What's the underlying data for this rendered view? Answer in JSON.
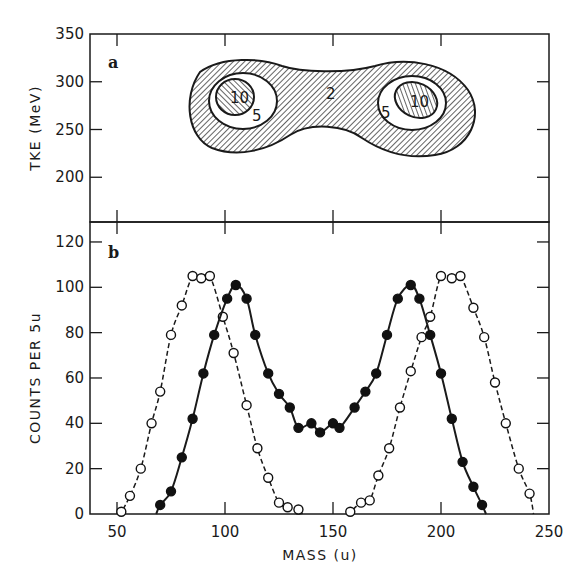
{
  "figure": {
    "panels": [
      {
        "id": "a",
        "label": "a"
      },
      {
        "id": "b",
        "label": "b"
      }
    ]
  },
  "chart_data": [
    {
      "type": "heatmap",
      "panel": "a",
      "title": "",
      "xlabel": "",
      "ylabel": "TKE (MeV)",
      "xlim": [
        40,
        250
      ],
      "ylim": [
        150,
        350
      ],
      "yticks": [
        200,
        250,
        300,
        350
      ],
      "xticks": [
        50,
        100,
        150,
        200,
        250
      ],
      "contour_levels": [
        2,
        5,
        10
      ],
      "contours": [
        {
          "level": 2,
          "label": "2",
          "label_pos": [
            150,
            288
          ],
          "extent_mass": [
            85,
            220
          ],
          "extent_tke": [
            225,
            325
          ]
        },
        {
          "level": 5,
          "label": "5",
          "label_pos": [
            104,
            260
          ],
          "center": [
            95,
            278
          ]
        },
        {
          "level": 10,
          "label": "10",
          "label_pos": [
            95,
            283
          ],
          "center": [
            95,
            282
          ]
        },
        {
          "level": 5,
          "label": "5",
          "label_pos": [
            186,
            264
          ],
          "center": [
            200,
            278
          ]
        },
        {
          "level": 10,
          "label": "10",
          "label_pos": [
            202,
            276
          ],
          "center": [
            202,
            276
          ]
        }
      ],
      "grid": false
    },
    {
      "type": "line",
      "panel": "b",
      "title": "",
      "xlabel": "MASS (u)",
      "ylabel": "COUNTS PER 5u",
      "xlim": [
        40,
        250
      ],
      "ylim": [
        0,
        125
      ],
      "xticks": [
        50,
        100,
        150,
        200,
        250
      ],
      "yticks": [
        0,
        20,
        40,
        60,
        80,
        100,
        120
      ],
      "grid": false,
      "series": [
        {
          "name": "open circles (dashed)",
          "marker": "open-circle",
          "line": "dashed",
          "x": [
            52,
            56,
            61,
            66,
            70,
            75,
            80,
            85,
            89,
            93,
            99,
            104,
            110,
            115,
            120,
            125,
            129,
            134,
            158,
            163,
            167,
            171,
            176,
            181,
            186,
            191,
            195,
            200,
            205,
            209,
            215,
            220,
            225,
            230,
            236,
            241
          ],
          "y": [
            1,
            8,
            20,
            40,
            54,
            79,
            92,
            105,
            104,
            105,
            87,
            71,
            48,
            29,
            16,
            5,
            3,
            2,
            1,
            5,
            6,
            17,
            29,
            47,
            63,
            78,
            87,
            105,
            104,
            105,
            91,
            78,
            58,
            40,
            20,
            9
          ]
        },
        {
          "name": "filled circles (solid)",
          "marker": "filled-circle",
          "line": "solid",
          "x": [
            70,
            75,
            80,
            85,
            90,
            95,
            101,
            105,
            110,
            114,
            120,
            125,
            130,
            134,
            140,
            144,
            150,
            153,
            160,
            165,
            170,
            175,
            180,
            186,
            190,
            195,
            200,
            205,
            210,
            215,
            219
          ],
          "y": [
            4,
            10,
            25,
            42,
            62,
            79,
            95,
            101,
            95,
            79,
            62,
            53,
            47,
            38,
            40,
            36,
            40,
            38,
            47,
            54,
            62,
            79,
            95,
            101,
            95,
            79,
            62,
            42,
            23,
            12,
            4
          ]
        }
      ]
    }
  ]
}
